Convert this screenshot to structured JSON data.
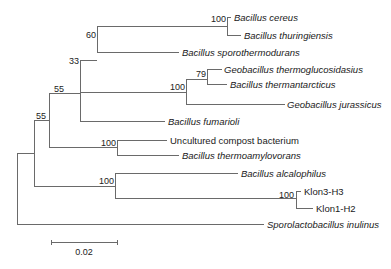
{
  "diagram": {
    "type": "phylogenetic-tree",
    "taxa": [
      {
        "id": "cereus",
        "label": "Bacillus cereus",
        "italic": true,
        "y": 17,
        "x_end": 231
      },
      {
        "id": "thuringiensis",
        "label": "Bacillus thuringiensis",
        "italic": true,
        "y": 35,
        "x_end": 241
      },
      {
        "id": "sporothermodurans",
        "label": "Bacillus sporothermodurans",
        "italic": true,
        "y": 52,
        "x_end": 179
      },
      {
        "id": "thermoglucosidasius",
        "label": "Geobacillus thermoglucosidasius",
        "italic": true,
        "y": 69,
        "x_end": 222
      },
      {
        "id": "thermantarcticus",
        "label": "Bacillus thermantarcticus",
        "italic": true,
        "y": 84,
        "x_end": 227
      },
      {
        "id": "jurassicus",
        "label": "Geobacillus jurassicus",
        "italic": true,
        "y": 104,
        "x_end": 285
      },
      {
        "id": "fumarioli",
        "label": "Bacillus fumarioli",
        "italic": true,
        "y": 121,
        "x_end": 165
      },
      {
        "id": "compost",
        "label": "Uncultured compost bacterium",
        "italic": false,
        "y": 140,
        "x_end": 167
      },
      {
        "id": "thermoamylovorans",
        "label": "Bacillus thermoamylovorans",
        "italic": true,
        "y": 155,
        "x_end": 179
      },
      {
        "id": "alcalophilus",
        "label": "Bacillus alcalophilus",
        "italic": true,
        "y": 173,
        "x_end": 238
      },
      {
        "id": "klon3",
        "label": "Klon3-H3",
        "italic": false,
        "y": 191,
        "x_end": 301
      },
      {
        "id": "klon1",
        "label": "Klon1-H2",
        "italic": false,
        "y": 208,
        "x_end": 313
      },
      {
        "id": "inulinus",
        "label": "Sporolactobacillus inulinus",
        "italic": true,
        "y": 224,
        "x_end": 264
      }
    ],
    "bootstrap": [
      {
        "node": "cereus-thuringiensis",
        "value": "100",
        "x": 227,
        "y": 17
      },
      {
        "node": "sporothermodurans-clade",
        "value": "60",
        "x": 97,
        "y": 26
      },
      {
        "node": "thermoglucosidasius-thermantarcticus",
        "value": "79",
        "x": 207,
        "y": 69
      },
      {
        "node": "geobacillus-clade",
        "value": "100",
        "x": 186,
        "y": 79
      },
      {
        "node": "fumarioli-clade",
        "value": "33",
        "x": 80,
        "y": 60
      },
      {
        "node": "upper-clade",
        "value": "55",
        "x": 49,
        "y": 93
      },
      {
        "node": "ingroup",
        "value": "55",
        "x": 34,
        "y": 120
      },
      {
        "node": "compost-thermoamylovorans",
        "value": "100",
        "x": 117,
        "y": 140
      },
      {
        "node": "alcalophilus-klon",
        "value": "100",
        "x": 115,
        "y": 173
      },
      {
        "node": "klon3-klon1",
        "value": "100",
        "x": 296,
        "y": 191
      }
    ],
    "scale_bar": {
      "label": "0.02",
      "x1": 51,
      "x2": 117,
      "y": 242,
      "label_y": 255
    }
  }
}
